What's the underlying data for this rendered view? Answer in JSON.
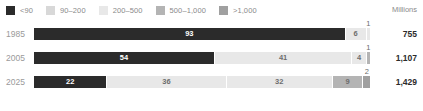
{
  "legend": {
    "units_label": "Millions",
    "items": [
      {
        "label": "<90",
        "color": "#2b2b2b"
      },
      {
        "label": "90–200",
        "color": "#d8d8d8"
      },
      {
        "label": "200–500",
        "color": "#e8e8e8"
      },
      {
        "label": "500–1,000",
        "color": "#b4b4b4"
      },
      {
        "label": ">1,000",
        "color": "#a0a0a0"
      }
    ]
  },
  "caption": {
    "text": ""
  },
  "chart_data": {
    "type": "bar",
    "title": "",
    "subtitle": "",
    "xlabel": "",
    "ylabel": "",
    "orientation": "horizontal",
    "stacked": true,
    "percent_stacked": true,
    "grid": false,
    "legend_position": "top",
    "xlim": [
      0,
      100
    ],
    "units": "Millions",
    "categories": [
      "1985",
      "2005",
      "2025"
    ],
    "series": [
      {
        "name": "<90",
        "color": "#2b2b2b",
        "values": [
          93,
          54,
          22
        ]
      },
      {
        "name": "90–200",
        "color": "#e8e8e8",
        "values": [
          6,
          41,
          36
        ]
      },
      {
        "name": "200–500",
        "color": "#e8e8e8",
        "values": [
          1,
          4,
          32
        ]
      },
      {
        "name": "500–1,000",
        "color": "#b4b4b4",
        "values": [
          0,
          1,
          9
        ]
      },
      {
        "name": ">1,000",
        "color": "#a0a0a0",
        "values": [
          0,
          0,
          2
        ]
      }
    ],
    "totals": [
      "755",
      "1,107",
      "1,429"
    ],
    "rows": [
      {
        "year": "1985",
        "total": "755",
        "segments": [
          {
            "label": "93",
            "value": 93,
            "color": "#2b2b2b",
            "label_placement": "inside-dark"
          },
          {
            "label": "6",
            "value": 6,
            "color": "#e8e8e8",
            "label_placement": "inside-light"
          },
          {
            "label": "1",
            "value": 1,
            "color": "#e8e8e8",
            "label_placement": "outside-above"
          }
        ]
      },
      {
        "year": "2005",
        "total": "1,107",
        "segments": [
          {
            "label": "54",
            "value": 54,
            "color": "#2b2b2b",
            "label_placement": "inside-dark"
          },
          {
            "label": "41",
            "value": 41,
            "color": "#e8e8e8",
            "label_placement": "inside-light"
          },
          {
            "label": "4",
            "value": 4,
            "color": "#e8e8e8",
            "label_placement": "inside-light"
          },
          {
            "label": "1",
            "value": 1,
            "color": "#b4b4b4",
            "label_placement": "outside-above"
          }
        ]
      },
      {
        "year": "2025",
        "total": "1,429",
        "segments": [
          {
            "label": "22",
            "value": 22,
            "color": "#2b2b2b",
            "label_placement": "inside-dark"
          },
          {
            "label": "36",
            "value": 36,
            "color": "#e8e8e8",
            "label_placement": "inside-light"
          },
          {
            "label": "32",
            "value": 32,
            "color": "#e8e8e8",
            "label_placement": "inside-light"
          },
          {
            "label": "9",
            "value": 9,
            "color": "#b4b4b4",
            "label_placement": "inside-light"
          },
          {
            "label": "2",
            "value": 2,
            "color": "#a0a0a0",
            "label_placement": "outside-above"
          }
        ]
      }
    ]
  }
}
